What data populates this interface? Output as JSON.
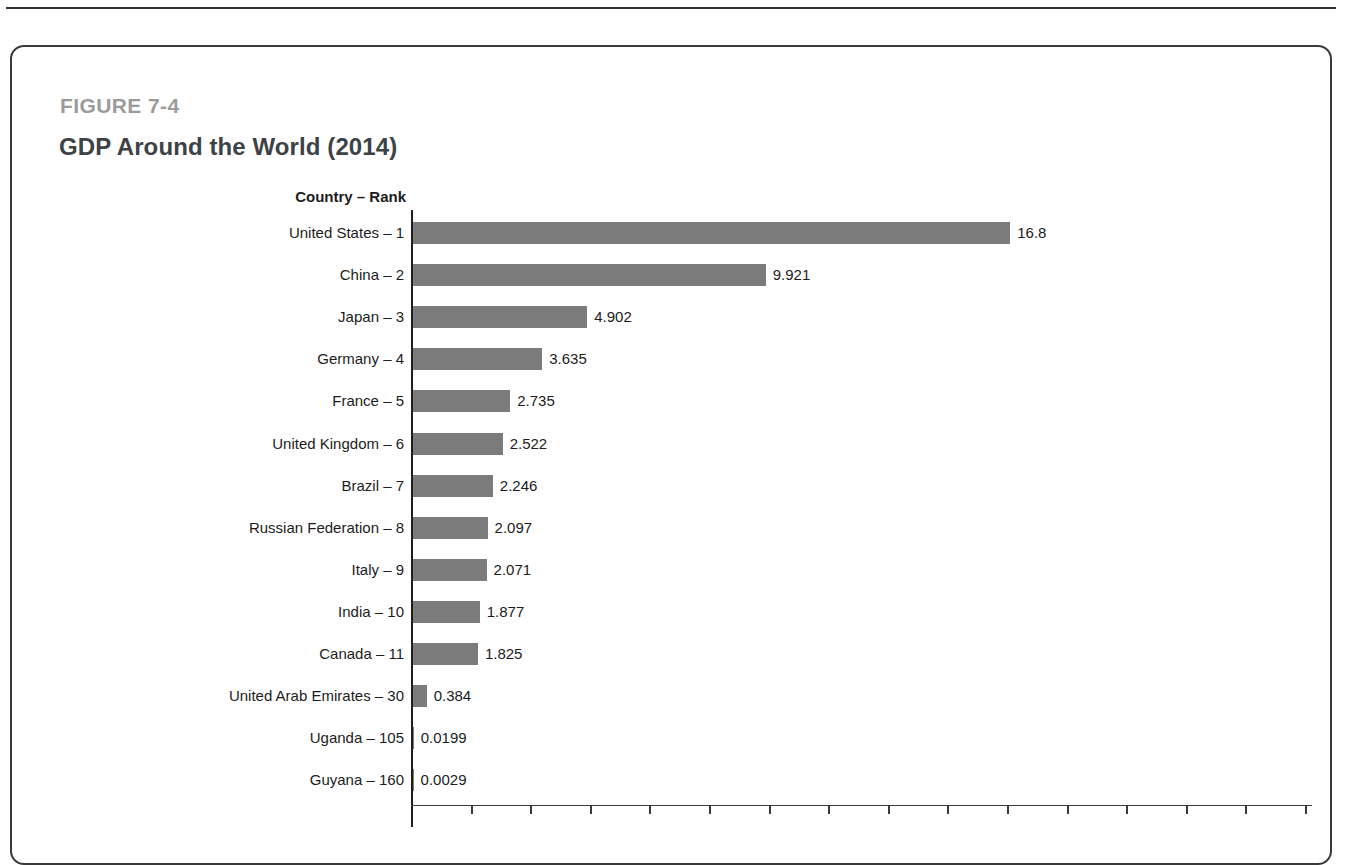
{
  "figure": {
    "number_label": "FIGURE 7-4",
    "title": "GDP Around the World (2014)"
  },
  "chart_data": {
    "type": "bar",
    "orientation": "horizontal",
    "title": "GDP Around the World (2014)",
    "axis_header": "Country – Rank",
    "xlabel": "",
    "ylabel": "Country – Rank",
    "xlim": [
      0,
      18
    ],
    "grid": false,
    "legend": false,
    "value_labels_shown": true,
    "categories": [
      "United States – 1",
      "China – 2",
      "Japan – 3",
      "Germany – 4",
      "France – 5",
      "United Kingdom – 6",
      "Brazil – 7",
      "Russian Federation – 8",
      "Italy – 9",
      "India – 10",
      "Canada – 11",
      "United Arab Emirates – 30",
      "Uganda – 105",
      "Guyana – 160"
    ],
    "values": [
      16.8,
      9.921,
      4.902,
      3.635,
      2.735,
      2.522,
      2.246,
      2.097,
      2.071,
      1.877,
      1.825,
      0.384,
      0.0199,
      0.0029
    ],
    "value_text": [
      "16.8",
      "9.921",
      "4.902",
      "3.635",
      "2.735",
      "2.522",
      "2.246",
      "2.097",
      "2.071",
      "1.877",
      "1.825",
      "0.384",
      "0.0199",
      "0.0029"
    ],
    "countries": [
      "United States",
      "China",
      "Japan",
      "Germany",
      "France",
      "United Kingdom",
      "Brazil",
      "Russian Federation",
      "Italy",
      "India",
      "Canada",
      "United Arab Emirates",
      "Uganda",
      "Guyana"
    ],
    "ranks": [
      1,
      2,
      3,
      4,
      5,
      6,
      7,
      8,
      9,
      10,
      11,
      30,
      105,
      160
    ],
    "bar_color": "#7b7b7b",
    "text_color": "#1c1c1c",
    "figure_label_color": "#9b9b9b",
    "title_color": "#3d4246"
  }
}
